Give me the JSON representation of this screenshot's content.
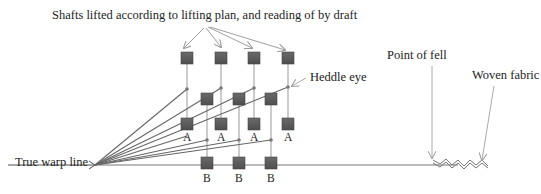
{
  "labels": {
    "title": "Shafts lifted according to lifting plan, and reading of by draft",
    "warp_line": "True warp line",
    "point_of_fell": "Point of fell",
    "heddle_eye": "Heddle eye",
    "woven_fabric": "Woven fabric"
  },
  "shaft_labels": {
    "a": [
      "A",
      "A",
      "A",
      "A"
    ],
    "b": [
      "B",
      "B",
      "B"
    ]
  },
  "colors": {
    "shaft_fill": "#5a5a5a",
    "line": "#888888",
    "warp": "#555555",
    "text": "#222222"
  }
}
